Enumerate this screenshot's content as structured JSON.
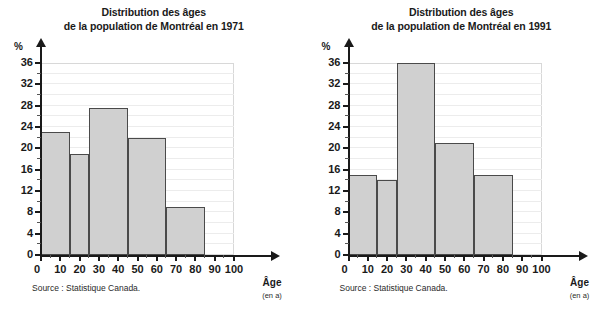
{
  "figure": {
    "background": "#ffffff",
    "bar_fill": "#d0d0d0",
    "bar_stroke": "#4a4a4a",
    "grid_color": "#ececec",
    "axis_color": "#1a1a1a"
  },
  "panels": [
    {
      "title_line1": "Distribution des âges",
      "title_line2": "de la population de Montréal en 1971",
      "source": "Source : Statistique Canada.",
      "axis_name": "Âge",
      "axis_unit": "(en a)",
      "y_unit": "%",
      "y_ticks": [
        "0",
        "4",
        "8",
        "12",
        "16",
        "20",
        "24",
        "28",
        "32",
        "36"
      ],
      "x_ticks": [
        "0",
        "10",
        "20",
        "30",
        "40",
        "50",
        "60",
        "70",
        "80",
        "90",
        "100"
      ]
    },
    {
      "title_line1": "Distribution des âges",
      "title_line2": "de la population de Montréal en 1991",
      "source": "Source : Statistique Canada.",
      "axis_name": "Âge",
      "axis_unit": "(en a)",
      "y_unit": "%",
      "y_ticks": [
        "0",
        "4",
        "8",
        "12",
        "16",
        "20",
        "24",
        "28",
        "32",
        "36"
      ],
      "x_ticks": [
        "0",
        "10",
        "20",
        "30",
        "40",
        "50",
        "60",
        "70",
        "80",
        "90",
        "100"
      ]
    }
  ],
  "chart_data": [
    {
      "type": "bar",
      "title": "Distribution des âges de la population de Montréal en 1971",
      "xlabel": "Âge (en a)",
      "ylabel": "%",
      "xlim": [
        0,
        100
      ],
      "ylim": [
        0,
        36
      ],
      "grid": true,
      "legend": "none",
      "bins": [
        {
          "label": "0-15",
          "x0": 0,
          "x1": 15,
          "value": 23
        },
        {
          "label": "15-25",
          "x0": 15,
          "x1": 25,
          "value": 19
        },
        {
          "label": "25-45",
          "x0": 25,
          "x1": 45,
          "value": 27.5
        },
        {
          "label": "45-65",
          "x0": 45,
          "x1": 65,
          "value": 22
        },
        {
          "label": "65-85",
          "x0": 65,
          "x1": 85,
          "value": 9
        }
      ],
      "categories": [
        "0-15",
        "15-25",
        "25-45",
        "45-65",
        "65-85"
      ],
      "values": [
        23,
        19,
        27.5,
        22,
        9
      ],
      "ytick_values": [
        0,
        4,
        8,
        12,
        16,
        20,
        24,
        28,
        32,
        36
      ],
      "xtick_values": [
        0,
        10,
        20,
        30,
        40,
        50,
        60,
        70,
        80,
        90,
        100
      ]
    },
    {
      "type": "bar",
      "title": "Distribution des âges de la population de Montréal en 1991",
      "xlabel": "Âge (en a)",
      "ylabel": "%",
      "xlim": [
        0,
        100
      ],
      "ylim": [
        0,
        36
      ],
      "grid": true,
      "legend": "none",
      "bins": [
        {
          "label": "0-15",
          "x0": 0,
          "x1": 15,
          "value": 15
        },
        {
          "label": "15-25",
          "x0": 15,
          "x1": 25,
          "value": 14
        },
        {
          "label": "25-45",
          "x0": 25,
          "x1": 45,
          "value": 36
        },
        {
          "label": "45-65",
          "x0": 45,
          "x1": 65,
          "value": 21
        },
        {
          "label": "65-85",
          "x0": 65,
          "x1": 85,
          "value": 15
        }
      ],
      "categories": [
        "0-15",
        "15-25",
        "25-45",
        "45-65",
        "65-85"
      ],
      "values": [
        15,
        14,
        36,
        21,
        15
      ],
      "ytick_values": [
        0,
        4,
        8,
        12,
        16,
        20,
        24,
        28,
        32,
        36
      ],
      "xtick_values": [
        0,
        10,
        20,
        30,
        40,
        50,
        60,
        70,
        80,
        90,
        100
      ]
    }
  ]
}
